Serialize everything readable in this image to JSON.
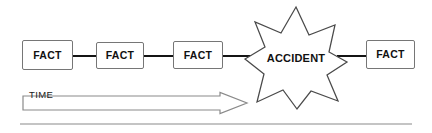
{
  "diagram": {
    "type": "event-sequence-flow",
    "background_color": "#ffffff",
    "nodes": [
      {
        "id": "fact-1",
        "shape": "rectangle",
        "label": "FACT"
      },
      {
        "id": "fact-2",
        "shape": "rectangle",
        "label": "FACT"
      },
      {
        "id": "fact-3",
        "shape": "rectangle",
        "label": "FACT"
      },
      {
        "id": "accident",
        "shape": "starburst-8-point",
        "label": "ACCIDENT"
      },
      {
        "id": "fact-4",
        "shape": "rectangle",
        "label": "FACT"
      }
    ],
    "connectors": [
      {
        "from": "fact-1",
        "to": "fact-2",
        "style": "solid-line",
        "color": "#141414"
      },
      {
        "from": "fact-2",
        "to": "fact-3",
        "style": "solid-line",
        "color": "#141414"
      },
      {
        "from": "fact-3",
        "to": "accident",
        "style": "solid-line",
        "color": "#141414"
      },
      {
        "from": "accident",
        "to": "fact-4",
        "style": "solid-line",
        "color": "#141414"
      }
    ],
    "axis": {
      "label": "TIME",
      "shape": "hollow-block-arrow",
      "direction": "left-to-right",
      "outline_color": "#8a8a8a"
    },
    "colors": {
      "box_border": "#767676",
      "star_outline": "#4a4a4a",
      "connector": "#141414",
      "text": "#111111",
      "rule": "#c4c4c4"
    }
  }
}
